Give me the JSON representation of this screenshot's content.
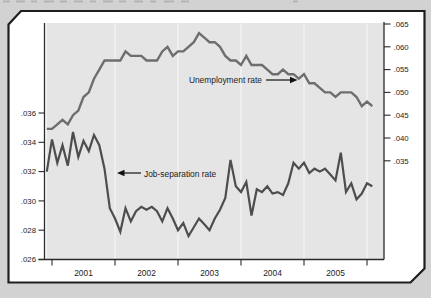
{
  "window": {
    "width": 431,
    "height": 298,
    "background": "#d2d2d2"
  },
  "panel": {
    "fill": "#ffffff",
    "border_color": "#1e1e1e",
    "plot_fill": "#e5e5e5",
    "gridline_color": "#f4f4f4",
    "axis_color": "#2a2a2a"
  },
  "chart_data": {
    "type": "line",
    "frequency": "monthly",
    "x_start": "2001-01",
    "x_end": "2006-03",
    "x_tick_labels": [
      "2001",
      "2002",
      "2003",
      "2004",
      "2005"
    ],
    "left_axis": {
      "series": "Job-separation rate",
      "ticks": [
        ".026",
        ".028",
        ".030",
        ".032",
        ".034",
        ".036"
      ],
      "min": 0.026,
      "max": 0.036
    },
    "right_axis": {
      "series": "Unemployment rate",
      "ticks": [
        ".035",
        ".040",
        ".045",
        ".050",
        ".055",
        ".060",
        ".065"
      ],
      "min": 0.035,
      "max": 0.065
    },
    "grid": "vertical-year-lines",
    "legend_position": "inline-annotations",
    "series": [
      {
        "name": "Unemployment rate",
        "axis": "right",
        "color": "#6e6e6e",
        "values": [
          0.042,
          0.042,
          0.043,
          0.044,
          0.043,
          0.045,
          0.046,
          0.049,
          0.05,
          0.053,
          0.055,
          0.057,
          0.057,
          0.057,
          0.057,
          0.059,
          0.058,
          0.058,
          0.058,
          0.057,
          0.057,
          0.057,
          0.059,
          0.06,
          0.058,
          0.059,
          0.059,
          0.06,
          0.061,
          0.063,
          0.062,
          0.061,
          0.061,
          0.06,
          0.058,
          0.057,
          0.057,
          0.056,
          0.058,
          0.056,
          0.056,
          0.056,
          0.055,
          0.054,
          0.054,
          0.055,
          0.054,
          0.054,
          0.053,
          0.054,
          0.052,
          0.052,
          0.051,
          0.05,
          0.05,
          0.049,
          0.05,
          0.05,
          0.05,
          0.049,
          0.047,
          0.048,
          0.047
        ]
      },
      {
        "name": "Job-separation rate",
        "axis": "left",
        "color": "#4d4d4d",
        "values": [
          0.032,
          0.0342,
          0.0326,
          0.0338,
          0.0324,
          0.0347,
          0.033,
          0.0341,
          0.0334,
          0.0345,
          0.0338,
          0.0322,
          0.0295,
          0.0288,
          0.0279,
          0.0295,
          0.0286,
          0.0293,
          0.0296,
          0.0294,
          0.0296,
          0.0293,
          0.0286,
          0.0295,
          0.0288,
          0.028,
          0.0285,
          0.0276,
          0.0282,
          0.0288,
          0.0284,
          0.028,
          0.0288,
          0.0294,
          0.0302,
          0.0328,
          0.031,
          0.0306,
          0.0313,
          0.029,
          0.0308,
          0.0306,
          0.031,
          0.0305,
          0.0306,
          0.0304,
          0.0312,
          0.0326,
          0.0322,
          0.0326,
          0.0319,
          0.0322,
          0.032,
          0.0322,
          0.0318,
          0.0314,
          0.0333,
          0.0306,
          0.0312,
          0.0301,
          0.0305,
          0.0312,
          0.031
        ]
      }
    ],
    "annotations": [
      {
        "text": "Unemployment rate",
        "arrow_direction": "right"
      },
      {
        "text": "Job-separation rate",
        "arrow_direction": "left"
      }
    ]
  }
}
